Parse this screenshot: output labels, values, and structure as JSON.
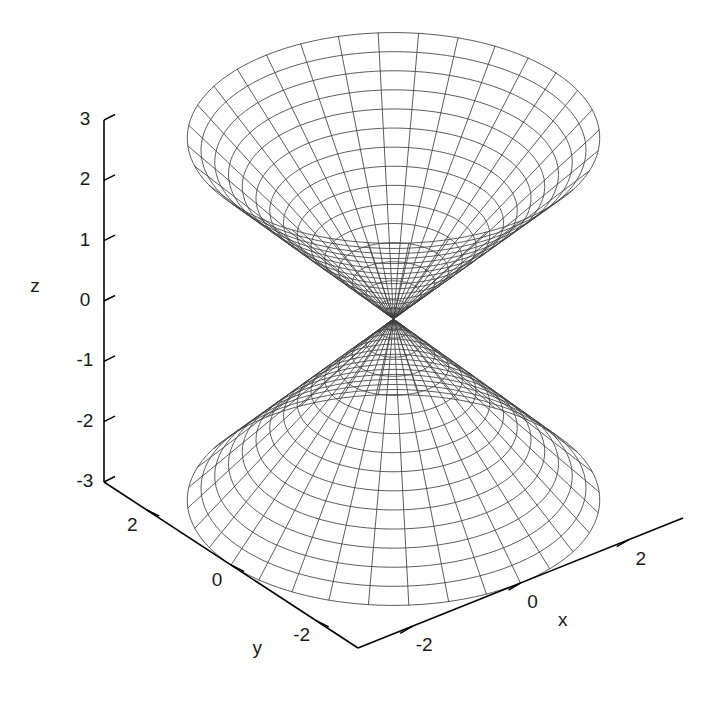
{
  "figure": {
    "kind": "3d-surface-wireframe",
    "background_color": "#ffffff",
    "line_color": "#404040",
    "axis_color": "#000000",
    "width": 716,
    "height": 714
  },
  "axes": {
    "x": {
      "label": "x",
      "ticks": [
        {
          "value": -2,
          "text": "-2"
        },
        {
          "value": 0,
          "text": "0"
        },
        {
          "value": 2,
          "text": "2"
        }
      ],
      "range": [
        -3,
        3
      ]
    },
    "y": {
      "label": "y",
      "ticks": [
        {
          "value": 2,
          "text": "2"
        },
        {
          "value": 0,
          "text": "0"
        },
        {
          "value": -2,
          "text": "-2"
        }
      ],
      "range": [
        -3,
        3
      ]
    },
    "z": {
      "label": "z",
      "ticks": [
        {
          "value": 3,
          "text": "3"
        },
        {
          "value": 2,
          "text": "2"
        },
        {
          "value": 1,
          "text": "1"
        },
        {
          "value": 0,
          "text": "0"
        },
        {
          "value": -1,
          "text": "-1"
        },
        {
          "value": -2,
          "text": "-2"
        },
        {
          "value": -3,
          "text": "-3"
        }
      ],
      "range": [
        -3,
        3
      ]
    }
  },
  "chart_data": {
    "type": "line",
    "title": "",
    "xlabel": "x",
    "ylabel": "y",
    "zlabel": "z",
    "surface": "two-sheet hyperboloid / double cone: z = ± sqrt(x^2 + y^2)",
    "sheets": [
      {
        "name": "upper-sheet",
        "z_sign": 1,
        "apex": {
          "x": 0,
          "y": 0,
          "z": 0
        },
        "z_range": [
          0,
          3
        ],
        "ring_count": 15
      },
      {
        "name": "lower-sheet",
        "z_sign": -1,
        "apex": {
          "x": 0,
          "y": 0,
          "z": 0
        },
        "z_range": [
          -3,
          0
        ],
        "ring_count": 15
      }
    ],
    "rings_z_upper": [
      0.2,
      0.4,
      0.6,
      0.8,
      1.0,
      1.2,
      1.4,
      1.6,
      1.8,
      2.0,
      2.2,
      2.4,
      2.6,
      2.8,
      3.0
    ],
    "rings_z_lower": [
      -0.2,
      -0.4,
      -0.6,
      -0.8,
      -1.0,
      -1.2,
      -1.4,
      -1.6,
      -1.8,
      -2.0,
      -2.2,
      -2.4,
      -2.6,
      -2.8,
      -3.0
    ],
    "radial_line_count": 32,
    "xlim": [
      -3,
      3
    ],
    "ylim": [
      -3,
      3
    ],
    "zlim": [
      -3,
      3
    ],
    "grid": false,
    "legend": null,
    "projection": {
      "rot_x_deg": 60,
      "rot_z_deg": 30,
      "scale": 1.0
    }
  }
}
